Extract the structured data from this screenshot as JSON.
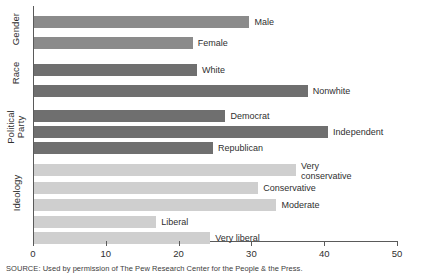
{
  "chart_data": {
    "type": "bar",
    "orientation": "horizontal",
    "title": "",
    "xlabel": "",
    "ylabel": "",
    "xlim": [
      0,
      50
    ],
    "xticks": [
      0,
      10,
      20,
      30,
      40,
      50
    ],
    "xtick_labels": [
      "0",
      "10",
      "20",
      "30",
      "40",
      "50"
    ],
    "grid": false,
    "legend": "none",
    "groups": [
      {
        "name": "Gender",
        "color": "#8b8b8b",
        "categories": [
          "Male",
          "Female"
        ],
        "values": [
          29.6,
          21.8
        ]
      },
      {
        "name": "Race",
        "color": "#6f6f6f",
        "categories": [
          "White",
          "Nonwhite"
        ],
        "values": [
          22.4,
          37.6
        ]
      },
      {
        "name": "Political\nParty",
        "color": "#6f6f6f",
        "categories": [
          "Democrat",
          "Independent",
          "Republican"
        ],
        "values": [
          26.3,
          40.4,
          24.6
        ]
      },
      {
        "name": "Ideology",
        "color": "#cfcfcf",
        "categories": [
          "Very\nconservative",
          "Conservative",
          "Moderate",
          "Liberal",
          "Very liberal"
        ],
        "values": [
          36.0,
          30.8,
          33.3,
          16.8,
          24.2
        ]
      }
    ],
    "bars": [
      {
        "label": "Male",
        "value": 29.6,
        "group": "Gender",
        "color": "#8b8b8b"
      },
      {
        "label": "Female",
        "value": 21.8,
        "group": "Gender",
        "color": "#8b8b8b"
      },
      {
        "label": "White",
        "value": 22.4,
        "group": "Race",
        "color": "#6f6f6f"
      },
      {
        "label": "Nonwhite",
        "value": 37.6,
        "group": "Race",
        "color": "#6f6f6f"
      },
      {
        "label": "Democrat",
        "value": 26.3,
        "group": "Political Party",
        "color": "#6f6f6f"
      },
      {
        "label": "Independent",
        "value": 40.4,
        "group": "Political Party",
        "color": "#6f6f6f"
      },
      {
        "label": "Republican",
        "value": 24.6,
        "group": "Political Party",
        "color": "#6f6f6f"
      },
      {
        "label": "Very\nconservative",
        "value": 36.0,
        "group": "Ideology",
        "color": "#cfcfcf"
      },
      {
        "label": "Conservative",
        "value": 30.8,
        "group": "Ideology",
        "color": "#cfcfcf"
      },
      {
        "label": "Moderate",
        "value": 33.3,
        "group": "Ideology",
        "color": "#cfcfcf"
      },
      {
        "label": "Liberal",
        "value": 16.8,
        "group": "Ideology",
        "color": "#cfcfcf"
      },
      {
        "label": "Very liberal",
        "value": 24.2,
        "group": "Ideology",
        "color": "#cfcfcf"
      }
    ]
  },
  "group_labels": [
    {
      "text": "Gender",
      "lines": 1
    },
    {
      "text": "Race",
      "lines": 1
    },
    {
      "text": "Political\nParty",
      "lines": 2
    },
    {
      "text": "Ideology",
      "lines": 1
    }
  ],
  "source": {
    "text": "SOURCE: Used by permission of The Pew Research Center for the People & the Press."
  },
  "axis": {
    "ticks": [
      "0",
      "10",
      "20",
      "30",
      "40",
      "50"
    ]
  }
}
